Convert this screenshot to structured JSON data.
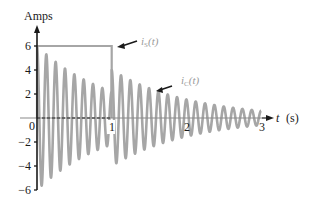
{
  "chart_data": {
    "type": "line",
    "title": "",
    "xlabel": "t (s)",
    "ylabel": "Amps",
    "xlim": [
      0,
      3
    ],
    "ylim": [
      -6,
      6
    ],
    "grid": false,
    "x_ticks": [
      "0",
      "1",
      "2",
      "3"
    ],
    "y_ticks": [
      "6",
      "4",
      "2",
      "-2",
      "-4",
      "-6"
    ],
    "series": [
      {
        "name": "i_S(t)",
        "style": "square pulse",
        "x": [
          0,
          0,
          1,
          1
        ],
        "values": [
          0,
          6,
          6,
          0
        ]
      },
      {
        "name": "i_C(t)",
        "style": "damped oscillation, approx 8 cycles per second, re-excited at t = 1",
        "segments": [
          {
            "t_start": 0,
            "t_end": 1,
            "initial_amplitude": 6,
            "positive_peaks": [
              5.3,
              4.7,
              4.2,
              3.6,
              3.2,
              2.8,
              2.5,
              2.2
            ],
            "negative_peaks": [
              -5.8,
              -5.0,
              -4.5,
              -4.0,
              -3.4,
              -3.0,
              -2.6,
              -2.2
            ]
          },
          {
            "t_start": 1,
            "t_end": 3,
            "initial_amplitude": 4,
            "positive_peaks_sample": [
              3.8,
              3.5,
              3.2,
              2.9,
              2.6,
              2.3,
              2.1,
              1.9,
              1.7,
              1.5,
              1.3,
              1.2,
              1.0,
              0.9,
              0.8,
              0.7
            ],
            "negative_peaks_sample": [
              -3.8,
              -3.4,
              -3.1,
              -2.8
            ]
          }
        ]
      }
    ],
    "annotations": [
      {
        "text": "i_S(t)",
        "points_to": "top edge of square pulse near t = 1"
      },
      {
        "text": "i_C(t)",
        "points_to": "oscillation peak near t = 1.3"
      }
    ],
    "legend": "none (inline arrow labels)"
  },
  "labels": {
    "ylabel": "Amps",
    "xlabel_var": "t",
    "xlabel_unit": "(s)",
    "is_label_main": "i",
    "is_label_sub": "S",
    "is_label_arg": "(t)",
    "ic_label_main": "i",
    "ic_label_sub": "C",
    "ic_label_arg": "(t)",
    "x0": "0",
    "x1": "1",
    "x2": "2",
    "x3": "3",
    "y6": "6",
    "y4": "4",
    "y2": "2",
    "ym2": "−2",
    "ym4": "−4",
    "ym6": "−6"
  },
  "colors": {
    "waveform": "#a6a6a6",
    "pulse": "#a6a6a6",
    "axis": "#1a1a1a",
    "label_gray": "#9a9a9a"
  }
}
